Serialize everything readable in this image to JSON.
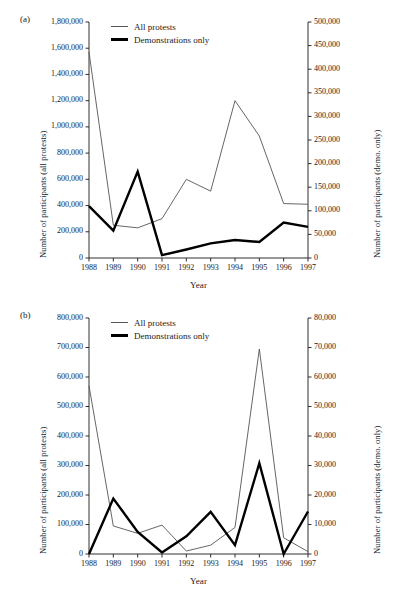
{
  "figure": {
    "panels": [
      {
        "panel_label": "(a)",
        "legend": [
          {
            "name": "all-protests",
            "label": "All protests",
            "style": "thin"
          },
          {
            "name": "demonstrations-only",
            "label": "Demonstrations only",
            "style": "thick"
          }
        ],
        "chart_data": {
          "type": "line",
          "title": "",
          "xlabel": "Year",
          "ylabel": "Number of participants (all protests)",
          "y2label": "Number of participants (demo. only)",
          "x": [
            1988,
            1989,
            1990,
            1991,
            1992,
            1993,
            1994,
            1995,
            1996,
            1997
          ],
          "xtick_labels": [
            "1988",
            "1989",
            "1990",
            "1991",
            "1992",
            "1993",
            "1994",
            "1995",
            "1996",
            "1997"
          ],
          "ylim": [
            0,
            1800000
          ],
          "yticks": [
            0,
            200000,
            400000,
            600000,
            800000,
            1000000,
            1200000,
            1400000,
            1600000,
            1800000
          ],
          "ytick_labels": [
            "0",
            "200,000",
            "400,000",
            "600,000",
            "800,000",
            "1,000,000",
            "1,200,000",
            "1,400,000",
            "1,600,000",
            "1,800,000"
          ],
          "y2lim": [
            0,
            500000
          ],
          "y2ticks": [
            0,
            50000,
            100000,
            150000,
            200000,
            250000,
            300000,
            350000,
            400000,
            450000,
            500000
          ],
          "y2tick_labels": [
            "0",
            "50,000",
            "100,000",
            "150,000",
            "200,000",
            "250,000",
            "300,000",
            "350,000",
            "400,000",
            "450,000",
            "500,000"
          ],
          "grid": false,
          "legend_position": "top-left-inside",
          "series": [
            {
              "name": "All protests",
              "axis": "left",
              "style": "thin",
              "color": "#555555",
              "values": [
                1570000,
                250000,
                230000,
                300000,
                600000,
                510000,
                1200000,
                930000,
                415000,
                410000
              ]
            },
            {
              "name": "Demonstrations only",
              "axis": "right",
              "style": "thick",
              "color": "#000000",
              "values": [
                110000,
                58000,
                183000,
                6000,
                18000,
                31000,
                38000,
                34000,
                75000,
                66000
              ]
            }
          ]
        }
      },
      {
        "panel_label": "(b)",
        "legend": [
          {
            "name": "all-protests",
            "label": "All protests",
            "style": "thin"
          },
          {
            "name": "demonstrations-only",
            "label": "Demonstrations only",
            "style": "thick"
          }
        ],
        "chart_data": {
          "type": "line",
          "title": "",
          "xlabel": "Year",
          "ylabel": "Number of participants (all protests)",
          "y2label": "Number of participants (demo. only)",
          "x": [
            1988,
            1989,
            1990,
            1991,
            1992,
            1993,
            1994,
            1995,
            1996,
            1997
          ],
          "xtick_labels": [
            "1988",
            "1989",
            "1990",
            "1991",
            "1992",
            "1993",
            "1994",
            "1995",
            "1996",
            "1997"
          ],
          "ylim": [
            0,
            800000
          ],
          "yticks": [
            0,
            100000,
            200000,
            300000,
            400000,
            500000,
            600000,
            700000,
            800000
          ],
          "ytick_labels": [
            "0",
            "100,000",
            "200,000",
            "300,000",
            "400,000",
            "500,000",
            "600,000",
            "700,000",
            "800,000"
          ],
          "y2lim": [
            0,
            80000
          ],
          "y2ticks": [
            0,
            10000,
            20000,
            30000,
            40000,
            50000,
            60000,
            70000,
            80000
          ],
          "y2tick_labels": [
            "0",
            "10,000",
            "20,000",
            "30,000",
            "40,000",
            "50,000",
            "60,000",
            "70,000",
            "80,000"
          ],
          "grid": false,
          "legend_position": "top-left-inside",
          "series": [
            {
              "name": "All protests",
              "axis": "left",
              "style": "thin",
              "color": "#555555",
              "values": [
                570000,
                95000,
                70000,
                98000,
                10000,
                30000,
                90000,
                695000,
                55000,
                8000
              ]
            },
            {
              "name": "Demonstrations only",
              "axis": "right",
              "style": "thick",
              "color": "#000000",
              "values": [
                0,
                18800,
                7500,
                500,
                6000,
                14300,
                3000,
                30800,
                0,
                14400
              ]
            }
          ]
        }
      }
    ]
  }
}
